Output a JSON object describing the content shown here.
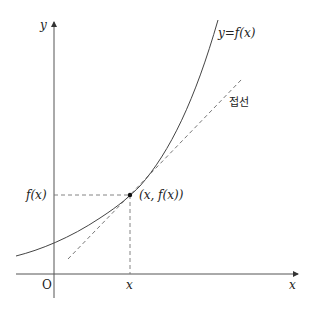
{
  "diagram": {
    "labels": {
      "y_axis": "y",
      "x_axis": "x",
      "origin": "O",
      "curve": "y=f(x)",
      "tangent": "접선",
      "fx": "f(x)",
      "point": "(x, f(x))",
      "x_tick": "x"
    },
    "colors": {
      "axis": "#555555",
      "curve": "#444444",
      "tangent": "#666666",
      "guide": "#777777",
      "point": "#111111"
    }
  }
}
